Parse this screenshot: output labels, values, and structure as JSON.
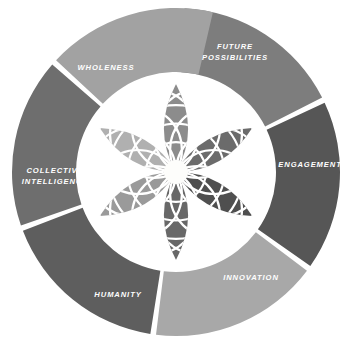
{
  "diagram": {
    "type": "radial-segmented-donut",
    "background_color": "#ffffff",
    "center_motif": {
      "name": "six-petal-rosette",
      "petal_count": 6,
      "lattice_lines_color": "#ffffff",
      "hub_color": "#fdfdfb",
      "hub_radius": 12
    },
    "ring": {
      "center_x": 176,
      "center_y": 172,
      "outer_radius": 164,
      "inner_radius": 100,
      "gap_degrees": 5
    },
    "segments": [
      {
        "id": "future-possibilities",
        "label": "FUTURE POSSIBILITIES",
        "label_lines": [
          "FUTURE",
          "POSSIBILITIES"
        ],
        "color": "#7d7d7d",
        "start_angle": -87,
        "end_angle": -27,
        "label_x": 235,
        "label_y": 52
      },
      {
        "id": "engagement",
        "label": "ENGAGEMENT",
        "label_lines": [
          "ENGAGEMENT"
        ],
        "color": "#565656",
        "start_angle": -25,
        "end_angle": 35,
        "label_x": 310,
        "label_y": 165
      },
      {
        "id": "innovation",
        "label": "INNOVATION",
        "label_lines": [
          "INNOVATION"
        ],
        "color": "#a8a8a8",
        "start_angle": 37,
        "end_angle": 97,
        "label_x": 251,
        "label_y": 278
      },
      {
        "id": "humanity",
        "label": "HUMANITY",
        "label_lines": [
          "HUMANITY"
        ],
        "color": "#5e5e5e",
        "start_angle": 99,
        "end_angle": 159,
        "label_x": 118,
        "label_y": 295
      },
      {
        "id": "collective-intelligence",
        "label": "COLLECTIVE INTELLIGENCE",
        "label_lines": [
          "COLLECTIVE",
          "INTELLIGENCE"
        ],
        "color": "#6e6e6e",
        "start_angle": 161,
        "end_angle": 221,
        "label_x": 55,
        "label_y": 176
      },
      {
        "id": "wholeness",
        "label": "WHOLENESS",
        "label_lines": [
          "WHOLENESS"
        ],
        "color": "#a2a2a2",
        "start_angle": 223,
        "end_angle": 283,
        "label_x": 106,
        "label_y": 68
      }
    ],
    "petals": [
      {
        "id": "petal-1",
        "color": "#8c8c8c",
        "angle": 0
      },
      {
        "id": "petal-2",
        "color": "#6b6b6b",
        "angle": 60
      },
      {
        "id": "petal-3",
        "color": "#4f4f4f",
        "angle": 120
      },
      {
        "id": "petal-4",
        "color": "#686868",
        "angle": 180
      },
      {
        "id": "petal-5",
        "color": "#9a9a9a",
        "angle": 240
      },
      {
        "id": "petal-6",
        "color": "#b0b0b0",
        "angle": 300
      }
    ]
  }
}
